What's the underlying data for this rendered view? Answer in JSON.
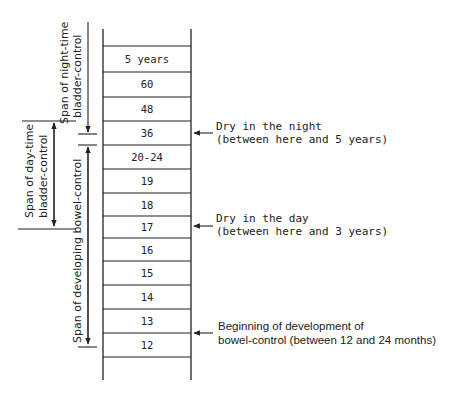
{
  "diagram": {
    "title": "",
    "ladder": {
      "cells": [
        "5 years",
        "60",
        "48",
        "36",
        "20-24",
        "19",
        "18",
        "17",
        "16",
        "15",
        "14",
        "13",
        "12"
      ],
      "units_note": "months unless stated"
    },
    "spans": [
      {
        "id": "night",
        "label_line1": "Span of night-time",
        "label_line2": "bladder-control",
        "from": "36",
        "to": "top"
      },
      {
        "id": "day",
        "label_line1": "Span of day-time",
        "label_line2": "bladder-control",
        "from": "17",
        "to": "36"
      },
      {
        "id": "bowel",
        "label_line1": "Span of developing bowel-control",
        "label_line2": "",
        "from": "12",
        "to": "20-24"
      }
    ],
    "annotations": [
      {
        "id": "dry-night",
        "line1": "Dry in the night",
        "line2": "(between here and 5 years)",
        "at": "36"
      },
      {
        "id": "dry-day",
        "line1": "Dry in the day",
        "line2": "(between here and 3 years)",
        "at": "17"
      },
      {
        "id": "bowel-begin",
        "line1": "Beginning of development of",
        "line2": "bowel-control (between 12 and 24 months)",
        "at": "13/12 boundary"
      }
    ]
  }
}
